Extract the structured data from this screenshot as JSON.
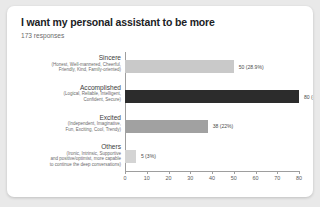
{
  "card": {
    "title": "I want my personal assistant to be more",
    "subtitle": "173 responses"
  },
  "chart_data": {
    "type": "bar",
    "orientation": "horizontal",
    "title": "I want my personal assistant to be more",
    "subtitle": "173 responses",
    "xlabel": "",
    "ylabel": "",
    "xlim": [
      0,
      80
    ],
    "xticks": [
      "0",
      "10",
      "20",
      "30",
      "40",
      "50",
      "60",
      "70",
      "80"
    ],
    "grid": false,
    "legend": false,
    "categories": [
      "Sincere",
      "Accomplished",
      "Excited",
      "Others"
    ],
    "category_descriptions": [
      [
        "(Honest, Well-mannered, Cheerful,",
        "Friendly, Kind, Family-oriented)"
      ],
      [
        "(Logical, Reliable, Intelligent,",
        "Confident, Secure)"
      ],
      [
        "(Independent, Imaginative,",
        "Fun, Exciting, Cool, Trendy)"
      ],
      [
        "(Ironic, Intrinsic, Supportive",
        "and positive/optimist, more capable",
        "to continue the deep conversations)"
      ]
    ],
    "values": [
      50,
      80,
      38,
      5
    ],
    "percents": [
      "28.9%",
      "46.2%",
      "22%",
      "3%"
    ],
    "data_labels": [
      "50 (28.9%)",
      "80 (46.2%)",
      "38 (22%)",
      "5 (3%)"
    ],
    "bar_colors": [
      "#c9c9c9",
      "#2c2c2c",
      "#a1a1a1",
      "#d4d4d4"
    ],
    "axis_color": "#9e9e9e"
  }
}
